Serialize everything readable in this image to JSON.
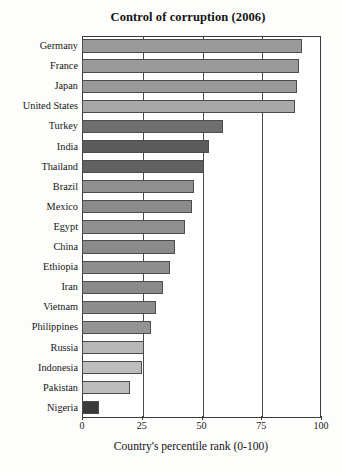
{
  "chart_data": {
    "type": "bar",
    "orientation": "horizontal",
    "title": "Control of corruption (2006)",
    "xlabel": "Country's percentile rank (0-100)",
    "ylabel": "",
    "xlim": [
      0,
      100
    ],
    "xticks": [
      0,
      25,
      50,
      75,
      100
    ],
    "grid": "vertical",
    "legend": "none",
    "categories": [
      "Germany",
      "France",
      "Japan",
      "United States",
      "Turkey",
      "India",
      "Thailand",
      "Brazil",
      "Mexico",
      "Egypt",
      "China",
      "Ethiopia",
      "Iran",
      "Vietnam",
      "Philippines",
      "Russia",
      "Indonesia",
      "Pakistan",
      "Nigeria"
    ],
    "values": [
      92,
      91,
      90,
      89,
      59,
      53,
      51,
      47,
      46,
      43,
      39,
      37,
      34,
      31,
      29,
      26,
      25,
      20,
      7
    ],
    "bar_colors": [
      "#9a9a9a",
      "#9a9a9a",
      "#9a9a9a",
      "#a8a8a8",
      "#6f6f6f",
      "#5c5c5c",
      "#616161",
      "#8f8f8f",
      "#8b8b8b",
      "#8f8f8f",
      "#8b8b8b",
      "#8e8e8e",
      "#8a8a8a",
      "#8d8d8d",
      "#949494",
      "#b8b8b8",
      "#bdbdbd",
      "#bdbdbd",
      "#3a3a3a"
    ]
  },
  "colors": {
    "axis": "#3a3a3a",
    "grid": "#4a4a4a",
    "text": "#141414",
    "background": "#fdfdfc"
  }
}
